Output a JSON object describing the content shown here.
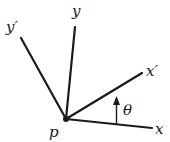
{
  "diagram": {
    "origin": {
      "label": "p",
      "x": 66,
      "y": 119
    },
    "axes": [
      {
        "id": "x",
        "label": "x",
        "end": {
          "x": 152,
          "y": 128
        },
        "label_pos": {
          "x": 155,
          "y": 134
        }
      },
      {
        "id": "y",
        "label": "y",
        "end": {
          "x": 75,
          "y": 27
        },
        "label_pos": {
          "x": 72,
          "y": 16
        }
      },
      {
        "id": "x-prime",
        "label": "x′",
        "end": {
          "x": 142,
          "y": 73
        },
        "label_pos": {
          "x": 146,
          "y": 76
        }
      },
      {
        "id": "y-prime",
        "label": "y′",
        "end": {
          "x": 21,
          "y": 38
        },
        "label_pos": {
          "x": 6,
          "y": 32
        }
      }
    ],
    "angle": {
      "label": "θ",
      "label_pos": {
        "x": 123,
        "y": 115
      }
    },
    "colors": {
      "stroke": "#1a1a1a",
      "background": "#ffffff"
    }
  }
}
